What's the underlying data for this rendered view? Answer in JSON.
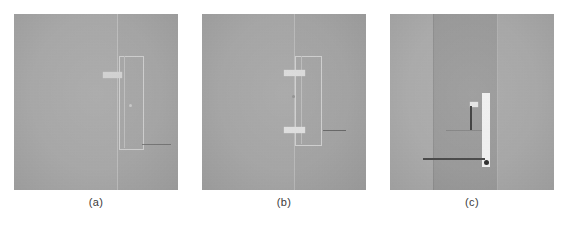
{
  "figure": {
    "background_color": "#ffffff",
    "panel_count": 3,
    "caption_color": "#3a3a3a"
  },
  "panels": [
    {
      "id": "panel-a",
      "label": "(a)",
      "base_color": "#a8a8a8",
      "x": 14,
      "y": 14,
      "width": 164,
      "height": 176,
      "caption_x": 14,
      "caption_y": 196,
      "caption_width": 164,
      "bands": [
        {
          "name": "left-region",
          "x_pct": 0,
          "width_pct": 63,
          "color": "#a9a9a9"
        },
        {
          "name": "right-region",
          "x_pct": 63,
          "width_pct": 37,
          "color": "#a6a6a6"
        }
      ],
      "vertical_boundary": {
        "name": "grain-boundary",
        "x_pct": 63.0,
        "color": "#c2c2c2",
        "width_px": 1
      },
      "rect_outline": {
        "name": "implant-outline",
        "x_pct": 64.0,
        "y_pct": 24.0,
        "width_pct": 14.0,
        "height_pct": 52.0,
        "color": "#cfcfcf",
        "border_px": 1
      },
      "inner_line": {
        "name": "inner-edge",
        "x_pct": 67.0,
        "y_pct": 24.0,
        "height_pct": 52.0,
        "color": "#bfbfbf"
      },
      "h_marks": [
        {
          "name": "upper-ledge",
          "x_pct": 54.0,
          "y_pct": 33.0,
          "width_pct": 12.0,
          "height_pct": 3.2,
          "color": "#d2d2d2"
        }
      ],
      "dot": {
        "name": "precipitate-dot",
        "x_pct": 70.0,
        "y_pct": 51.0,
        "size_px": 3,
        "color": "#c9c9c9"
      },
      "arrow": {
        "name": "feature-arrow",
        "x_pct": 78.0,
        "y_pct": 74.0,
        "length_pct": 18.0,
        "color": "#6f6f6f"
      }
    },
    {
      "id": "panel-b",
      "label": "(b)",
      "base_color": "#a6a6a6",
      "x": 202,
      "y": 14,
      "width": 164,
      "height": 176,
      "caption_x": 202,
      "caption_y": 196,
      "caption_width": 164,
      "bands": [
        {
          "name": "left-region",
          "x_pct": 0,
          "width_pct": 56,
          "color": "#a7a7a7"
        },
        {
          "name": "right-region",
          "x_pct": 56,
          "width_pct": 44,
          "color": "#a4a4a4"
        }
      ],
      "vertical_boundary": {
        "name": "grain-boundary",
        "x_pct": 56.0,
        "color": "#c0c0c0",
        "width_px": 1
      },
      "rect_outline": {
        "name": "implant-outline",
        "x_pct": 57.0,
        "y_pct": 24.0,
        "width_pct": 15.0,
        "height_pct": 50.0,
        "color": "#d0d0d0",
        "border_px": 1
      },
      "inner_line": {
        "name": "inner-edge",
        "x_pct": 60.5,
        "y_pct": 24.0,
        "height_pct": 50.0,
        "color": "#bdbdbd"
      },
      "h_marks": [
        {
          "name": "upper-ledge",
          "x_pct": 50.0,
          "y_pct": 32.0,
          "width_pct": 13.0,
          "height_pct": 3.4,
          "color": "#dcdcdc"
        },
        {
          "name": "lower-ledge",
          "x_pct": 50.0,
          "y_pct": 64.0,
          "width_pct": 13.0,
          "height_pct": 3.4,
          "color": "#e0e0e0"
        }
      ],
      "dot": {
        "name": "precipitate-dot",
        "x_pct": 55.0,
        "y_pct": 46.0,
        "size_px": 3,
        "color": "#8f8f8f"
      },
      "arrow": {
        "name": "feature-arrow",
        "x_pct": 74.0,
        "y_pct": 66.0,
        "length_pct": 14.0,
        "color": "#5e5e5e"
      }
    },
    {
      "id": "panel-c",
      "label": "(c)",
      "base_color": "#a8a8a8",
      "x": 390,
      "y": 14,
      "width": 164,
      "height": 176,
      "caption_x": 390,
      "caption_y": 196,
      "caption_width": 164,
      "bands": [
        {
          "name": "left-grain",
          "x_pct": 0,
          "width_pct": 26.0,
          "color": "#acacac"
        },
        {
          "name": "center-grain",
          "x_pct": 26.0,
          "width_pct": 39.0,
          "color": "#9b9b9b"
        },
        {
          "name": "right-grain",
          "x_pct": 65.0,
          "width_pct": 35.0,
          "color": "#a9a9a9"
        }
      ],
      "vertical_boundary": {
        "name": "grain-boundary",
        "x_pct": 26.0,
        "color": "#8e8e8e",
        "width_px": 1
      },
      "vertical_boundary_2": {
        "name": "grain-boundary-right",
        "x_pct": 65.0,
        "color": "#b4b4b4",
        "width_px": 1
      },
      "bar": {
        "name": "bright-lamella",
        "x_pct": 56.0,
        "y_pct": 45.0,
        "width_pct": 5.0,
        "height_pct": 42.0,
        "color": "#f2f2f2"
      },
      "h_marks": [
        {
          "name": "short-tick",
          "x_pct": 48.5,
          "y_pct": 50.0,
          "width_pct": 5.0,
          "height_pct": 3.0,
          "color": "#e8e8e8"
        }
      ],
      "dot": {
        "name": "dark-precipitate",
        "x_pct": 57.5,
        "y_pct": 83.0,
        "size_px": 5,
        "color": "#2f2f2f"
      },
      "arrow": {
        "name": "vertical-arrow",
        "x_pct": 49.0,
        "y_pct": 52.0,
        "length_pct": 14.0,
        "color": "#3c3c3c"
      },
      "arrow_h": {
        "name": "horizontal-arrow",
        "x_pct": 20.0,
        "y_pct": 82.0,
        "length_pct": 38.0,
        "color": "#4a4a4a"
      },
      "bracket": {
        "name": "measurement-bracket",
        "x_pct": 34.0,
        "y_pct": 66.0,
        "width_pct": 22.0,
        "color": "#7c7c7c"
      }
    }
  ]
}
